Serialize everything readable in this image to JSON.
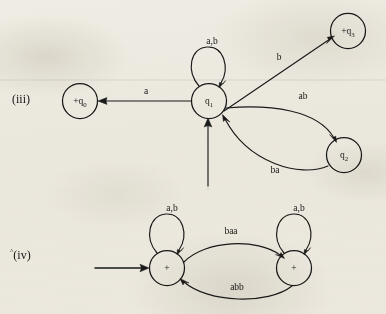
{
  "figure": {
    "background_color": "#efece4",
    "ink_color": "#191919",
    "parts": [
      {
        "id": "iii",
        "marker": "(iii)",
        "caret": "",
        "states": [
          {
            "id": "q0",
            "label_plus": "+",
            "label_q": "q",
            "label_sub": "0",
            "accepting": true
          },
          {
            "id": "q1",
            "label_plus": "",
            "label_q": "q",
            "label_sub": "1",
            "accepting": false
          },
          {
            "id": "q2",
            "label_plus": "",
            "label_q": "q",
            "label_sub": "2",
            "accepting": false
          },
          {
            "id": "q3",
            "label_plus": "+",
            "label_q": "q",
            "label_sub": "3",
            "accepting": true
          }
        ],
        "transitions": [
          {
            "from": "q1",
            "to": "q0",
            "label": "a"
          },
          {
            "from": "q1",
            "to": "q1",
            "label": "a,b"
          },
          {
            "from": "q1",
            "to": "q3",
            "label": "b"
          },
          {
            "from": "q1",
            "to": "q2",
            "label": "ab"
          },
          {
            "from": "q2",
            "to": "q1",
            "label": "ba"
          }
        ],
        "start_state": "q1"
      },
      {
        "id": "iv",
        "marker": "(iv)",
        "caret": "^",
        "states": [
          {
            "id": "s1",
            "label_plus": "+",
            "label_q": "",
            "label_sub": "",
            "accepting": true
          },
          {
            "id": "s2",
            "label_plus": "+",
            "label_q": "",
            "label_sub": "",
            "accepting": true
          }
        ],
        "transitions": [
          {
            "from": "s1",
            "to": "s1",
            "label": "a,b"
          },
          {
            "from": "s2",
            "to": "s2",
            "label": "a,b"
          },
          {
            "from": "s1",
            "to": "s2",
            "label": "baa"
          },
          {
            "from": "s2",
            "to": "s1",
            "label": "abb"
          }
        ],
        "start_state": "s1"
      }
    ]
  }
}
